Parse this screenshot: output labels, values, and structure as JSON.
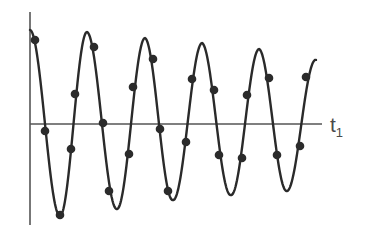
{
  "chart_data": {
    "type": "line",
    "title": "",
    "xlabel": "t1",
    "ylabel": "",
    "grid": false,
    "legend": null,
    "axis": {
      "x_label_main": "t",
      "x_label_sub": "1",
      "origin_px": [
        30,
        124
      ],
      "x_end_px": 322,
      "y_top_px": 12,
      "y_bottom_px": 225
    },
    "curve": {
      "form": "A(t)*cos(2*pi*t/period)",
      "start_px": 30,
      "end_px": 316,
      "period_px": 57.5,
      "amplitude_start_px": 94,
      "amplitude_end_px": 70,
      "peaks_px": [
        [
          30,
          30
        ],
        [
          87,
          32
        ],
        [
          145,
          38
        ],
        [
          202,
          43
        ],
        [
          259,
          49
        ]
      ],
      "troughs_px": [
        [
          60,
          216
        ],
        [
          117,
          209
        ],
        [
          173,
          200
        ],
        [
          231,
          195
        ],
        [
          287,
          191
        ]
      ]
    },
    "samples_px": [
      [
        35,
        40
      ],
      [
        45,
        131
      ],
      [
        60,
        215
      ],
      [
        71,
        149
      ],
      [
        75,
        94
      ],
      [
        94,
        47
      ],
      [
        103,
        123
      ],
      [
        109,
        191
      ],
      [
        129,
        154
      ],
      [
        133,
        87
      ],
      [
        153,
        59
      ],
      [
        160,
        129
      ],
      [
        168,
        191
      ],
      [
        186,
        142
      ],
      [
        192,
        79
      ],
      [
        214,
        90
      ],
      [
        219,
        155
      ],
      [
        242,
        158
      ],
      [
        247,
        95
      ],
      [
        269,
        78
      ],
      [
        277,
        155
      ],
      [
        300,
        146
      ],
      [
        306,
        77
      ]
    ]
  }
}
